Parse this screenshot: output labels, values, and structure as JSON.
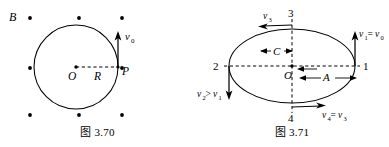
{
  "page": {
    "background_color": "#ffffff",
    "ink_color": "#000000",
    "width": 389,
    "height": 147
  },
  "figures": [
    {
      "id": "fig-3-70",
      "caption": "图 3.70",
      "description": "Charged particle moving in a circle of radius R in a uniform magnetic field B directed out of the page, with velocity v0 tangent at point P.",
      "field_label": "B",
      "field_symbol": "out-of-page-dots",
      "field_dot_count": 8,
      "circle": {
        "center_label": "O",
        "radius_label": "R",
        "point_on_circle_label": "P"
      },
      "velocity": {
        "label": "v",
        "subscript": "0",
        "direction": "up"
      }
    },
    {
      "id": "fig-3-71",
      "caption": "图 3.71",
      "description": "Elliptical trajectory with center O, labelled points 1, 2, 3, 4 and velocity vectors at each point; semi-axes A and C marked.",
      "center_label": "O",
      "semi_axis_horizontal_label": "A",
      "semi_axis_vertical_label": "C",
      "points": [
        {
          "name": "1",
          "label": "1",
          "position": "right"
        },
        {
          "name": "2",
          "label": "2",
          "position": "left"
        },
        {
          "name": "3",
          "label": "3",
          "position": "top"
        },
        {
          "name": "4",
          "label": "4",
          "position": "bottom"
        }
      ],
      "velocity_labels": [
        {
          "at_point": "1",
          "text": "v₁=v₀",
          "base": "v",
          "sub": "1",
          "relation": "=",
          "other": "v",
          "other_sub": "0",
          "direction": "up"
        },
        {
          "at_point": "2",
          "text": "v₂>v₁",
          "base": "v",
          "sub": "2",
          "relation": ">",
          "other": "v",
          "other_sub": "1",
          "direction": "down"
        },
        {
          "at_point": "3",
          "text": "v₃",
          "base": "v",
          "sub": "3",
          "relation": "",
          "other": "",
          "other_sub": "",
          "direction": "left"
        },
        {
          "at_point": "4",
          "text": "v₄=v₃",
          "base": "v",
          "sub": "4",
          "relation": "=",
          "other": "v",
          "other_sub": "3",
          "direction": "right"
        }
      ]
    }
  ]
}
